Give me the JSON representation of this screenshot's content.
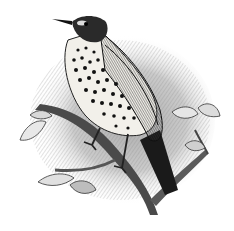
{
  "image": {
    "subject": "song thrush perched on a branch",
    "style": "black-and-white engraving",
    "colors": {
      "background": "#ffffff",
      "ink": "#111111",
      "shade": "#9a9a9a",
      "light_shade": "#cfcfcf",
      "breast": "#f2f0ea"
    }
  }
}
